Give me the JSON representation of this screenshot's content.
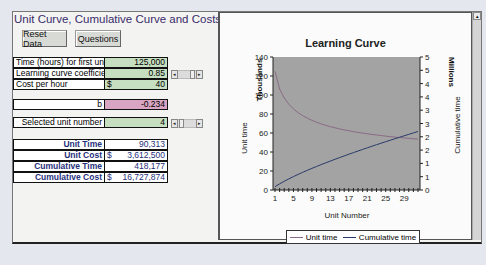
{
  "sheet": {
    "title": "Unit Curve, Cumulative Curve and Costs",
    "buttons": {
      "reset": "Reset Data",
      "questions": "Questions"
    }
  },
  "inputs": [
    {
      "label": "Time (hours) for first unit",
      "prefix": "",
      "value": "125,000"
    },
    {
      "label": "Learning curve coefficient",
      "prefix": "",
      "value": "0.85"
    },
    {
      "label": "Cost per hour",
      "prefix": "$",
      "value": "40"
    }
  ],
  "b_row": {
    "label": "b",
    "value": "-0.234"
  },
  "selected_unit": {
    "label": "Selected unit number",
    "value": "4"
  },
  "results": [
    {
      "label": "Unit Time",
      "prefix": "",
      "value": "90,313"
    },
    {
      "label": "Unit Cost",
      "prefix": "$",
      "value": "3,612,500"
    },
    {
      "label": "Cumulative Time",
      "prefix": "",
      "value": "418,177"
    },
    {
      "label": "Cumulative Cost",
      "prefix": "$",
      "value": "16,727,874"
    }
  ],
  "scroll_arrows": {
    "left": "◂",
    "right": "▸",
    "up": "▴"
  },
  "colors": {
    "input_green": "#c7dfc1",
    "b_pink": "#d8a6c2",
    "result_text": "#1f2f7a",
    "title_text": "#3a2a6a",
    "plot_bg": "#a3a3a3",
    "unit_line": "#8a6a86",
    "cumulative_line": "#2a3a6a"
  },
  "chart_data": {
    "type": "line",
    "title": "Learning Curve",
    "xlabel": "Unit Number",
    "ylabel": "Unit time",
    "ylabel_units": "Thousands",
    "y2label": "Cumulative time",
    "y2label_units": "Millions",
    "x_ticks": [
      "1",
      "5",
      "9",
      "13",
      "17",
      "21",
      "25",
      "29"
    ],
    "y_ticks": [
      "0",
      "20",
      "40",
      "60",
      "80",
      "100",
      "120",
      "140"
    ],
    "y2_ticks": [
      "0",
      "1",
      "1",
      "2",
      "2",
      "3",
      "3",
      "4",
      "4",
      "5",
      "5"
    ],
    "ylim": [
      0,
      140
    ],
    "y2lim": [
      0,
      5
    ],
    "x": [
      1,
      2,
      3,
      4,
      5,
      6,
      7,
      8,
      9,
      10,
      11,
      12,
      13,
      14,
      15,
      16,
      17,
      18,
      19,
      20,
      21,
      22,
      23,
      24,
      25,
      26,
      27,
      28,
      29,
      30,
      31,
      32
    ],
    "series": [
      {
        "name": "Unit time",
        "axis": "left",
        "values": [
          125,
          106.3,
          96.9,
          90.3,
          85.4,
          81.4,
          78.3,
          75.6,
          73.3,
          71.4,
          69.6,
          68.1,
          66.7,
          65.5,
          64.3,
          63.3,
          62.4,
          61.5,
          60.6,
          59.9,
          59.2,
          58.5,
          57.9,
          57.3,
          56.7,
          56.2,
          55.7,
          55.2,
          54.8,
          54.4,
          53.9,
          53.6
        ]
      },
      {
        "name": "Cumulative time",
        "axis": "right",
        "values": [
          0.125,
          0.231,
          0.328,
          0.418,
          0.504,
          0.585,
          0.664,
          0.739,
          0.813,
          0.884,
          0.954,
          1.022,
          1.088,
          1.154,
          1.218,
          1.281,
          1.344,
          1.405,
          1.466,
          1.526,
          1.585,
          1.644,
          1.702,
          1.759,
          1.816,
          1.872,
          1.928,
          1.983,
          2.038,
          2.092,
          2.146,
          2.2
        ]
      }
    ],
    "legend": [
      "Unit time",
      "Cumulative time"
    ],
    "legend_position": "bottom",
    "grid": false
  }
}
